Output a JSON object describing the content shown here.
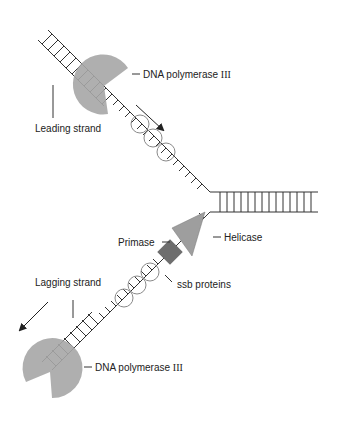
{
  "diagram": {
    "labels": {
      "dna_pol_top": "DNA polymerase",
      "dna_pol_top_roman": "III",
      "leading_strand": "Leading strand",
      "helicase": "Helicase",
      "primase": "Primase",
      "ssb_proteins": "ssb proteins",
      "lagging_strand": "Lagging strand",
      "dna_pol_bottom": "DNA polymerase",
      "dna_pol_bottom_roman": "III"
    },
    "colors": {
      "line": "#333333",
      "polymerase": "#a6a6a6",
      "helicase": "#9e9e9e",
      "primase": "#6e6e6e",
      "ssb_circle": "#8a8a8a"
    }
  }
}
